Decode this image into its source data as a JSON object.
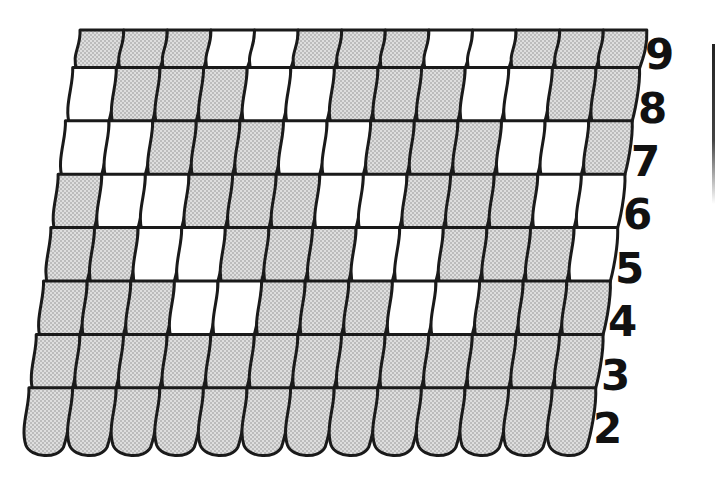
{
  "diagram": {
    "type": "scale-pattern-puzzle",
    "colors": {
      "outline": "#1a1a1a",
      "shaded_fill": "#d9d9d9",
      "shaded_dot": "#8a8a8a",
      "white_fill": "#ffffff",
      "label": "#111111"
    },
    "scales_per_row": 13,
    "rows": [
      {
        "label": "9",
        "pattern": "SSSWWSSSWWSSS"
      },
      {
        "label": "8",
        "pattern": "WSSSWWSSSWWSS"
      },
      {
        "label": "7",
        "pattern": "WWSSSWWSSSWWS"
      },
      {
        "label": "6",
        "pattern": "SWWSSSWWSSSWW"
      },
      {
        "label": "5",
        "pattern": "SSWWSSSWWSSSW"
      },
      {
        "label": "4",
        "pattern": "SSSWWSSSWWSSS"
      },
      {
        "label": "3",
        "pattern": "SSSSSSSSSSSSS"
      },
      {
        "label": "2",
        "pattern": "SSSSSSSSSSSSS"
      }
    ],
    "legend": {
      "S": "shaded (dotted) scale",
      "W": "white scale"
    }
  }
}
